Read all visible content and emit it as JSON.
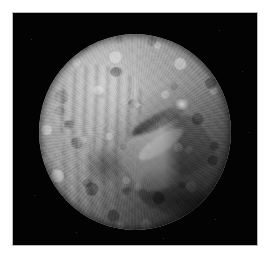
{
  "page": {
    "background_color": "#ffffff",
    "width": 276,
    "height": 257
  },
  "photo": {
    "alt_text": "Miranda, moon of Uranus",
    "frame_border_color": "#b9b9b9",
    "space_color": "#000000",
    "caption": ""
  },
  "subject": {
    "name": "Miranda",
    "disk_surface_color": "#9a9a9a",
    "disk_highlight_color": "#c9c9c9",
    "disk_shadow_color": "#2b2b2b",
    "features": [
      {
        "id": "arden-corona",
        "label": "Arden Corona"
      },
      {
        "id": "inverness-corona",
        "label": "Inverness Corona"
      },
      {
        "id": "elsinore-corona",
        "label": "Elsinore Corona"
      },
      {
        "id": "verona-rupes",
        "label": "Verona Rupes"
      },
      {
        "id": "dark-plain",
        "label": "Dark Plain"
      },
      {
        "id": "limb-highlight",
        "label": "Bright Limb Patch"
      },
      {
        "id": "crater-north",
        "label": "Northern Crater"
      },
      {
        "id": "crater-west",
        "label": "Western Crater"
      },
      {
        "id": "crater-south",
        "label": "Southern Crater"
      }
    ]
  },
  "starfield": [
    {
      "x": 18,
      "y": 26
    },
    {
      "x": 206,
      "y": 17
    },
    {
      "x": 229,
      "y": 58
    },
    {
      "x": 236,
      "y": 119
    },
    {
      "x": 21,
      "y": 182
    },
    {
      "x": 202,
      "y": 206
    },
    {
      "x": 63,
      "y": 219
    },
    {
      "x": 150,
      "y": 225
    }
  ]
}
